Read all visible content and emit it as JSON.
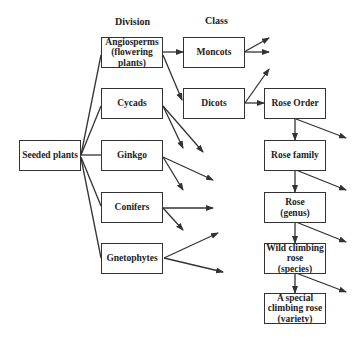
{
  "headers": {
    "division": "Division",
    "class": "Class"
  },
  "root": {
    "label": "Seeded plants"
  },
  "divisions": [
    {
      "label": "Angiosperms\n(flowering\nplants)"
    },
    {
      "label": "Cycads"
    },
    {
      "label": "Ginkgo"
    },
    {
      "label": "Conifers"
    },
    {
      "label": "Gnetophytes"
    }
  ],
  "classes": [
    {
      "label": "Moncots"
    },
    {
      "label": "Dicots"
    }
  ],
  "rose_chain": [
    {
      "label": "Rose Order"
    },
    {
      "label": "Rose family"
    },
    {
      "label": "Rose\n(genus)"
    },
    {
      "label": "Wild climbing\nrose\n(species)"
    },
    {
      "label": "A special\nclimbing rose\n(variety)"
    }
  ],
  "colors": {
    "line": "#333333",
    "background": "#ffffff"
  }
}
